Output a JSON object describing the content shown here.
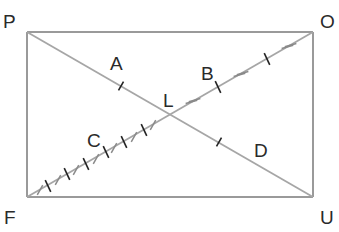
{
  "diagram": {
    "title": "",
    "shape": "rectangle with diagonals",
    "vertices": {
      "top_left": "P",
      "top_right": "O",
      "bottom_right": "U",
      "bottom_left": "F"
    },
    "intersection_label": "L",
    "region_labels": {
      "segment_PL": "A",
      "segment_LO": "B",
      "segment_FL": "C",
      "segment_LU": "D"
    },
    "edges": [
      "PO",
      "OU",
      "UF",
      "FP"
    ],
    "diagonals": [
      "PU",
      "FO"
    ],
    "tick_marks": {
      "segment_PL": "single tick",
      "segment_LU": "single tick",
      "segment_LO": "alternating double gray ticks and single dark ticks",
      "segment_FL": "alternating single gray slashes and single dark ticks"
    },
    "colors": {
      "lines": "#9a9a9a",
      "dark_ticks": "#222222",
      "labels": "#2a2a2a"
    }
  }
}
